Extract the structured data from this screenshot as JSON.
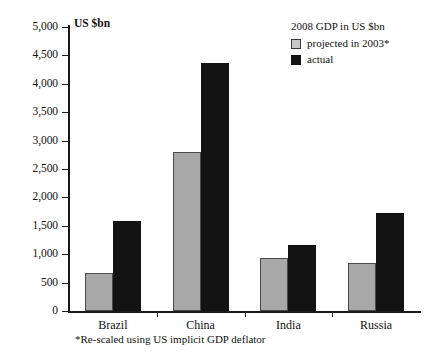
{
  "chart_data": {
    "type": "bar",
    "title": "",
    "subtitle": "",
    "xlabel": "",
    "ylabel": "US $bn",
    "ylim": [
      0,
      5000
    ],
    "grid": false,
    "legend_position": "top-right",
    "legend_title": "2008 GDP in US $bn",
    "categories": [
      "Brazil",
      "China",
      "India",
      "Russia"
    ],
    "series": [
      {
        "name": "projected in 2003*",
        "color": "#a8a8a8",
        "values": [
          670,
          2800,
          940,
          850
        ]
      },
      {
        "name": "actual",
        "color": "#131313",
        "values": [
          1590,
          4370,
          1170,
          1720
        ]
      }
    ],
    "ytick_labels": [
      "0",
      "500",
      "1,000",
      "1,500",
      "2,000",
      "2,500",
      "3,000",
      "3,500",
      "4,000",
      "4,500",
      "5,000"
    ],
    "ytick_values": [
      0,
      500,
      1000,
      1500,
      2000,
      2500,
      3000,
      3500,
      4000,
      4500,
      5000
    ],
    "annotations": [
      "*Re-scaled using US implicit GDP deflator"
    ]
  },
  "axis": {
    "unit_label": "US $bn"
  },
  "legend": {
    "title": "2008 GDP in US $bn",
    "items": [
      {
        "label": "projected in 2003*",
        "swatch": "projected"
      },
      {
        "label": "actual",
        "swatch": "actual"
      }
    ]
  },
  "footnote": {
    "text": "*Re-scaled using US implicit GDP deflator"
  }
}
